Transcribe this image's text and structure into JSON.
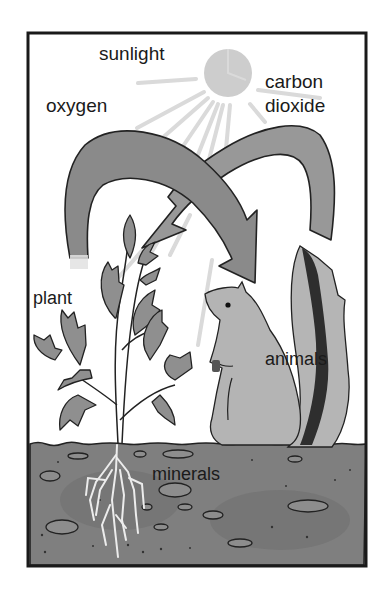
{
  "diagram": {
    "type": "ecosystem-cycle",
    "labels": {
      "sunlight": "sunlight",
      "oxygen": "oxygen",
      "carbon_dioxide_line1": "carbon",
      "carbon_dioxide_line2": "dioxide",
      "plant": "plant",
      "animals": "animals",
      "minerals": "minerals"
    },
    "arrows": [
      {
        "from": "plant",
        "to": "animals",
        "carries": "oxygen"
      },
      {
        "from": "animals",
        "to": "plant",
        "carries": "carbon dioxide"
      }
    ],
    "colors": {
      "frame": "#1a1a1a",
      "arrow_fill": "#8c8c8c",
      "sun": "#c8c8c8",
      "soil": "#7d7d7d",
      "leaf": "#8f8f8f",
      "squirrel": "#b0b0b0",
      "tail_stripe": "#2b2b2b",
      "roots": "#e6e6e6"
    }
  }
}
